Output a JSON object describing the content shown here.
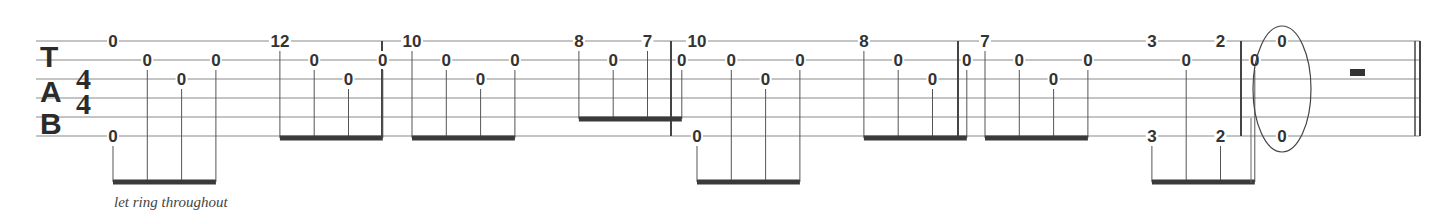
{
  "notation": {
    "clef": [
      "T",
      "A",
      "B"
    ],
    "time_signature": {
      "top": "4",
      "bottom": "4"
    },
    "strings": 6,
    "instruction": "let ring throughout",
    "colors": {
      "ink": "#333333",
      "staff": "#8a8a8a",
      "beam": "#3a3a3a"
    },
    "measures": [
      {
        "groups": [
          {
            "notes": [
              {
                "x": 0,
                "frets": [
                  {
                    "string": 1,
                    "fret": "0"
                  },
                  {
                    "string": 6,
                    "fret": "0"
                  }
                ],
                "stem_from": 6
              },
              {
                "x": 1,
                "frets": [
                  {
                    "string": 2,
                    "fret": "0"
                  }
                ]
              },
              {
                "x": 2,
                "frets": [
                  {
                    "string": 3,
                    "fret": "0"
                  }
                ]
              },
              {
                "x": 3,
                "frets": [
                  {
                    "string": 2,
                    "fret": "0"
                  }
                ]
              }
            ],
            "beam": "below"
          },
          {
            "notes": [
              {
                "x": 4,
                "frets": [
                  {
                    "string": 1,
                    "fret": "12"
                  }
                ]
              },
              {
                "x": 5,
                "frets": [
                  {
                    "string": 2,
                    "fret": "0"
                  }
                ]
              },
              {
                "x": 6,
                "frets": [
                  {
                    "string": 3,
                    "fret": "0"
                  }
                ]
              },
              {
                "x": 7,
                "frets": [
                  {
                    "string": 2,
                    "fret": "0"
                  }
                ]
              }
            ],
            "beam": "staff"
          }
        ]
      },
      {
        "groups": [
          {
            "notes": [
              {
                "x": 0,
                "frets": [
                  {
                    "string": 1,
                    "fret": "10"
                  }
                ]
              },
              {
                "x": 1,
                "frets": [
                  {
                    "string": 2,
                    "fret": "0"
                  }
                ]
              },
              {
                "x": 2,
                "frets": [
                  {
                    "string": 3,
                    "fret": "0"
                  }
                ]
              },
              {
                "x": 3,
                "frets": [
                  {
                    "string": 2,
                    "fret": "0"
                  }
                ]
              }
            ],
            "beam": "staff"
          },
          {
            "notes": [
              {
                "x": 4,
                "frets": [
                  {
                    "string": 1,
                    "fret": "8"
                  }
                ]
              },
              {
                "x": 5,
                "frets": [
                  {
                    "string": 2,
                    "fret": "0"
                  }
                ]
              },
              {
                "x": 6,
                "frets": [
                  {
                    "string": 1,
                    "fret": "7"
                  }
                ]
              },
              {
                "x": 7,
                "frets": [
                  {
                    "string": 2,
                    "fret": "0"
                  }
                ]
              }
            ],
            "beam": "high"
          }
        ]
      },
      {
        "groups": [
          {
            "notes": [
              {
                "x": 0,
                "frets": [
                  {
                    "string": 1,
                    "fret": "10"
                  },
                  {
                    "string": 6,
                    "fret": "0"
                  }
                ],
                "stem_from": 6
              },
              {
                "x": 1,
                "frets": [
                  {
                    "string": 2,
                    "fret": "0"
                  }
                ]
              },
              {
                "x": 2,
                "frets": [
                  {
                    "string": 3,
                    "fret": "0"
                  }
                ]
              },
              {
                "x": 3,
                "frets": [
                  {
                    "string": 2,
                    "fret": "0"
                  }
                ]
              }
            ],
            "beam": "below"
          },
          {
            "notes": [
              {
                "x": 4,
                "frets": [
                  {
                    "string": 1,
                    "fret": "8"
                  }
                ]
              },
              {
                "x": 5,
                "frets": [
                  {
                    "string": 2,
                    "fret": "0"
                  }
                ]
              },
              {
                "x": 6,
                "frets": [
                  {
                    "string": 3,
                    "fret": "0"
                  }
                ]
              },
              {
                "x": 7,
                "frets": [
                  {
                    "string": 2,
                    "fret": "0"
                  }
                ]
              }
            ],
            "beam": "staff"
          }
        ]
      },
      {
        "groups": [
          {
            "notes": [
              {
                "x": 0,
                "frets": [
                  {
                    "string": 1,
                    "fret": "7"
                  }
                ]
              },
              {
                "x": 1,
                "frets": [
                  {
                    "string": 2,
                    "fret": "0"
                  }
                ]
              },
              {
                "x": 2,
                "frets": [
                  {
                    "string": 3,
                    "fret": "0"
                  }
                ]
              },
              {
                "x": 3,
                "frets": [
                  {
                    "string": 2,
                    "fret": "0"
                  }
                ]
              }
            ],
            "beam": "staff"
          },
          {
            "notes": [
              {
                "x": 4,
                "frets": [
                  {
                    "string": 1,
                    "fret": "3"
                  },
                  {
                    "string": 6,
                    "fret": "3"
                  }
                ],
                "stem_from": 6
              },
              {
                "x": 5,
                "frets": [
                  {
                    "string": 2,
                    "fret": "0"
                  }
                ]
              },
              {
                "x": 6,
                "frets": [
                  {
                    "string": 1,
                    "fret": "2"
                  },
                  {
                    "string": 6,
                    "fret": "2"
                  }
                ],
                "stem_from": 6
              },
              {
                "x": 7,
                "frets": [
                  {
                    "string": 2,
                    "fret": "0"
                  }
                ]
              }
            ],
            "beam": "below"
          }
        ]
      },
      {
        "final": true,
        "whole_note": {
          "frets": [
            {
              "string": 1,
              "fret": "0"
            },
            {
              "string": 6,
              "fret": "0"
            }
          ],
          "circled": true
        },
        "rest": "half-rest"
      }
    ]
  }
}
